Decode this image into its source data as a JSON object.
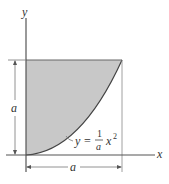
{
  "diagram": {
    "axes": {
      "x_label": "x",
      "y_label": "y"
    },
    "curve": {
      "equation_lhs": "y =",
      "fraction_numerator": "1",
      "fraction_denominator": "a",
      "term": "x",
      "exponent": "2"
    },
    "dimensions": {
      "vertical": "a",
      "horizontal": "a"
    },
    "colors": {
      "shade": "#c8c8c8",
      "line": "#555555",
      "background": "#ffffff"
    }
  }
}
